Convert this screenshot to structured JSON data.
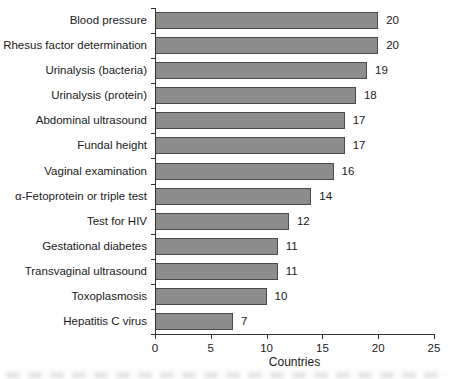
{
  "chart_data": {
    "type": "bar",
    "orientation": "horizontal",
    "title": "",
    "xlabel": "Countries",
    "ylabel": "",
    "categories": [
      "Blood pressure",
      "Rhesus factor determination",
      "Urinalysis (bacteria)",
      "Urinalysis (protein)",
      "Abdominal ultrasound",
      "Fundal height",
      "Vaginal examination",
      "α-Fetoprotein or triple test",
      "Test for HIV",
      "Gestational diabetes",
      "Transvaginal ultrasound",
      "Toxoplasmosis",
      "Hepatitis C virus"
    ],
    "values": [
      20,
      20,
      19,
      18,
      17,
      17,
      16,
      14,
      12,
      11,
      11,
      10,
      7
    ],
    "value_labels": [
      "20",
      "20",
      "19",
      "18",
      "17",
      "17",
      "16",
      "14",
      "12",
      "11",
      "11",
      "10",
      "7"
    ],
    "xlim": [
      0,
      25
    ],
    "x_ticks": [
      0,
      5,
      10,
      15,
      20,
      25
    ],
    "grid": false,
    "legend": null,
    "bar_color": "#8d8d8d",
    "bar_border_color": "#4a4a4a",
    "axis_color": "#333333",
    "text_color": "#1a1a1a"
  }
}
